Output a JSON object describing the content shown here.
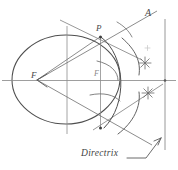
{
  "figure": {
    "kind": "hand-drawn geometric construction",
    "background_color": "#ffffff",
    "ink_color": "#5a5a5a",
    "faint_ink_color": "#9a9a9a",
    "labels": {
      "apex_point": "A",
      "curve_point": "P",
      "focus_left": "F",
      "focus_inner": "F",
      "directrix": "Directrix"
    },
    "elements": [
      {
        "name": "ellipse-curve",
        "type": "ellipse",
        "cx": 66,
        "cy": 80,
        "rx": 54,
        "ry": 44
      },
      {
        "name": "major-axis-line",
        "type": "line",
        "x1": 2,
        "y1": 80,
        "x2": 176,
        "y2": 80
      },
      {
        "name": "minor-axis-line",
        "type": "line",
        "x1": 67,
        "y1": 28,
        "x2": 67,
        "y2": 133
      },
      {
        "name": "ordinate-line-at-P",
        "type": "line",
        "x1": 100,
        "y1": 36,
        "x2": 100,
        "y2": 128
      },
      {
        "name": "directrix-line",
        "type": "line",
        "x1": 165,
        "y1": 20,
        "x2": 165,
        "y2": 148
      },
      {
        "name": "focal-ray-upper",
        "type": "line",
        "x1": 37,
        "y1": 80,
        "x2": 155,
        "y2": 12
      },
      {
        "name": "focal-ray-lower",
        "type": "line",
        "x1": 37,
        "y1": 80,
        "x2": 150,
        "y2": 143
      },
      {
        "name": "chord-F-to-P",
        "type": "line",
        "x1": 37,
        "y1": 80,
        "x2": 100,
        "y2": 36
      },
      {
        "name": "tangent-line-upper",
        "type": "line",
        "x1": 62,
        "y1": 21,
        "x2": 140,
        "y2": 58
      },
      {
        "name": "tangent-line-lower",
        "type": "line",
        "x1": 95,
        "y1": 128,
        "x2": 160,
        "y2": 86
      },
      {
        "name": "arc-upper-sweep",
        "type": "arc",
        "cx": 100,
        "cy": 80,
        "r": 48,
        "start_deg": -62,
        "end_deg": 14
      },
      {
        "name": "arc-lower-sweep",
        "type": "arc",
        "cx": 100,
        "cy": 80,
        "r": 44,
        "start_deg": 18,
        "end_deg": 74
      },
      {
        "name": "arc-small-inner",
        "type": "arc",
        "cx": 100,
        "cy": 80,
        "r": 22,
        "start_deg": -75,
        "end_deg": 50
      },
      {
        "name": "intersection-mark-upper",
        "type": "star",
        "cx": 145,
        "cy": 63,
        "r": 6
      },
      {
        "name": "intersection-mark-lower",
        "type": "star",
        "cx": 148,
        "cy": 93,
        "r": 6
      },
      {
        "name": "leader-line-directrix",
        "type": "leader",
        "x1": 131,
        "y1": 157,
        "x2": 160,
        "y2": 137
      },
      {
        "name": "arrow-head-F",
        "type": "arrow",
        "x": 37,
        "y": 80
      },
      {
        "name": "arrow-head-directrix",
        "type": "arrow",
        "x": 160,
        "y": 137
      }
    ]
  }
}
